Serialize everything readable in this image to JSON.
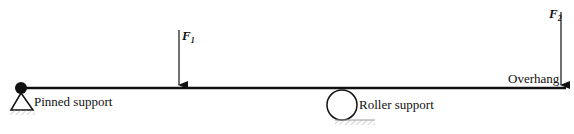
{
  "diagram": {
    "beam": {
      "x1": 20,
      "x2": 566,
      "y": 88,
      "color": "#111111"
    },
    "supports": [
      {
        "type": "pinned",
        "label": "Pinned support",
        "x": 21,
        "y": 88
      },
      {
        "type": "roller",
        "label": "Roller support",
        "x": 342,
        "y": 104
      }
    ],
    "forces": [
      {
        "name": "F",
        "subscript": "1",
        "x": 179,
        "y_start": 30,
        "y_end": 85
      },
      {
        "name": "F",
        "subscript": "2",
        "x": 561,
        "y_start": 12,
        "y_end": 85
      }
    ],
    "annotations": [
      {
        "text": "Overhang",
        "x": 508,
        "y": 84
      }
    ]
  }
}
